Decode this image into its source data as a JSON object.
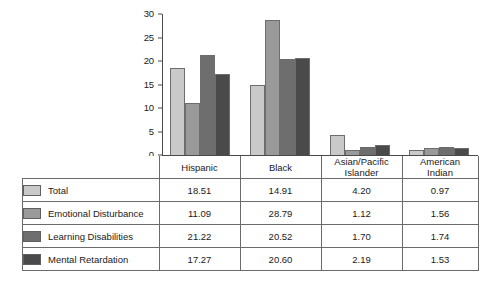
{
  "chart_data": {
    "type": "bar",
    "title": "",
    "subtitle": "",
    "xlabel": "",
    "ylabel": "",
    "ylim": [
      0,
      30
    ],
    "yticks": [
      0,
      5,
      10,
      15,
      20,
      25,
      30
    ],
    "grid": false,
    "legend_position": "table-row-labels",
    "categories": [
      "Hispanic",
      "Asian/Pacific Islander",
      "Black",
      "American Indian"
    ],
    "category_lines": [
      [
        "Hispanic",
        ""
      ],
      [
        "Black",
        ""
      ],
      [
        "Asian/Pacific",
        "Islander"
      ],
      [
        "American",
        "Indian"
      ]
    ],
    "series": [
      {
        "name": "Total",
        "color": "#c9c9c9",
        "values": [
          18.51,
          14.91,
          4.2,
          0.97
        ],
        "labels": [
          "18.51",
          "14.91",
          "4.20",
          "0.97"
        ]
      },
      {
        "name": "Emotional Disturbance",
        "color": "#9a9a9a",
        "values": [
          11.09,
          28.79,
          1.12,
          1.56
        ],
        "labels": [
          "11.09",
          "28.79",
          "1.12",
          "1.56"
        ]
      },
      {
        "name": "Learning Disabilities",
        "color": "#6e6e6e",
        "values": [
          21.22,
          20.52,
          1.7,
          1.74
        ],
        "labels": [
          "21.22",
          "20.52",
          "1.70",
          "1.74"
        ]
      },
      {
        "name": "Mental Retardation",
        "color": "#4a4a4a",
        "values": [
          17.27,
          20.6,
          2.19,
          1.53
        ],
        "labels": [
          "17.27",
          "20.60",
          "2.19",
          "1.53"
        ]
      }
    ]
  },
  "axis": {
    "tick_labels": [
      "30",
      "25",
      "20",
      "15",
      "10",
      "5",
      "0"
    ]
  },
  "table": {
    "header": [
      "",
      "Hispanic",
      "Black",
      "Asian/Pacific Islander",
      "American Indian"
    ],
    "rows": [
      {
        "label": "Total",
        "values": [
          "18.51",
          "14.91",
          "4.20",
          "0.97"
        ]
      },
      {
        "label": "Emotional Disturbance",
        "values": [
          "11.09",
          "28.79",
          "1.12",
          "1.56"
        ]
      },
      {
        "label": "Learning Disabilities",
        "values": [
          "21.22",
          "20.52",
          "1.70",
          "1.74"
        ]
      },
      {
        "label": "Mental Retardation",
        "values": [
          "17.27",
          "20.60",
          "2.19",
          "1.53"
        ]
      }
    ]
  }
}
